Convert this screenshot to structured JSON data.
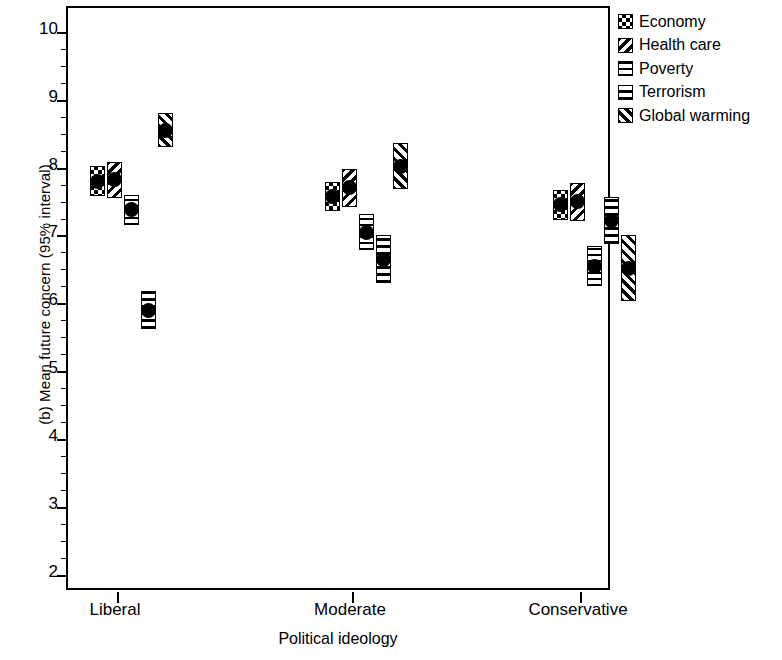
{
  "chart_data": {
    "type": "scatter",
    "title": "",
    "panel_label": "(b)",
    "xlabel": "Political ideology",
    "ylabel": "(b) Mean future concern (95% interval)",
    "categories": [
      "Liberal",
      "Moderate",
      "Conservative"
    ],
    "ylim": [
      1.75,
      10.35
    ],
    "yticks": [
      2,
      3,
      4,
      5,
      6,
      7,
      8,
      9,
      10
    ],
    "ytick_labels": [
      "2",
      "3",
      "4",
      "5",
      "6",
      "7",
      "8",
      "9",
      "10"
    ],
    "minor_ticks": true,
    "grid": false,
    "legend_position": "right",
    "error_bar_type": "95% interval",
    "series": [
      {
        "name": "Economy",
        "pattern": "checkerboard",
        "values": [
          7.8,
          7.57,
          7.45
        ],
        "ci_low": [
          7.58,
          7.36,
          7.23
        ],
        "ci_high": [
          8.02,
          7.79,
          7.67
        ]
      },
      {
        "name": "Health care",
        "pattern": "back-diagonal",
        "values": [
          7.82,
          7.7,
          7.5
        ],
        "ci_low": [
          7.55,
          7.42,
          7.22
        ],
        "ci_high": [
          8.08,
          7.98,
          7.78
        ]
      },
      {
        "name": "Poverty",
        "pattern": "grid-crosshatch",
        "values": [
          7.38,
          7.05,
          6.55
        ],
        "ci_low": [
          7.16,
          6.78,
          6.26
        ],
        "ci_high": [
          7.6,
          7.32,
          6.84
        ]
      },
      {
        "name": "Terrorism",
        "pattern": "horizontal-stripes",
        "values": [
          5.9,
          6.65,
          7.22
        ],
        "ci_low": [
          5.62,
          6.3,
          6.88
        ],
        "ci_high": [
          6.18,
          7.0,
          7.56
        ]
      },
      {
        "name": "Global warming",
        "pattern": "forward-diagonal",
        "values": [
          8.55,
          8.02,
          6.52
        ],
        "ci_low": [
          8.3,
          7.68,
          6.04
        ],
        "ci_high": [
          8.8,
          8.36,
          7.0
        ]
      }
    ]
  },
  "legend": {
    "items": [
      {
        "label": "Economy"
      },
      {
        "label": "Health care"
      },
      {
        "label": "Poverty"
      },
      {
        "label": "Terrorism"
      },
      {
        "label": "Global warming"
      }
    ]
  }
}
